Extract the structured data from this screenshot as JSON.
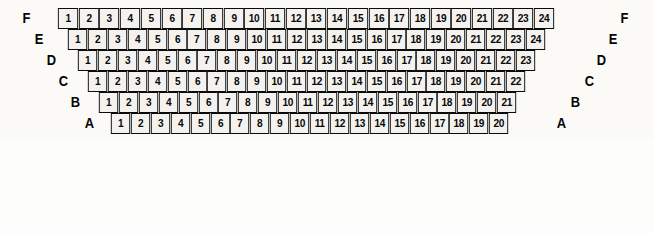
{
  "diagram": {
    "colors": {
      "seat_fill": "#f4f2ee",
      "seat_border": "#0a0a0a",
      "label_color": "#050505",
      "background": "#fbfaf7"
    },
    "rows": [
      {
        "letter": "F",
        "seat_count": 24,
        "seats": [
          1,
          2,
          3,
          4,
          5,
          6,
          7,
          8,
          9,
          10,
          11,
          12,
          13,
          14,
          15,
          16,
          17,
          18,
          19,
          20,
          21,
          22,
          23,
          24
        ],
        "left": 57,
        "top": 8,
        "seat_width": 22.1,
        "label_left_x": 22,
        "label_left_y": 10,
        "label_right_x": 620,
        "label_right_y": 10
      },
      {
        "letter": "E",
        "seat_count": 24,
        "seats": [
          1,
          2,
          3,
          4,
          5,
          6,
          7,
          8,
          9,
          10,
          11,
          12,
          13,
          14,
          15,
          16,
          17,
          18,
          19,
          20,
          21,
          22,
          23,
          24
        ],
        "left": 67,
        "top": 29,
        "seat_width": 21.3,
        "label_left_x": 34,
        "label_left_y": 31,
        "label_right_x": 608,
        "label_right_y": 31
      },
      {
        "letter": "D",
        "seat_count": 23,
        "seats": [
          1,
          2,
          3,
          4,
          5,
          6,
          7,
          8,
          9,
          10,
          11,
          12,
          13,
          14,
          15,
          16,
          17,
          18,
          19,
          20,
          21,
          22,
          23
        ],
        "left": 77,
        "top": 50,
        "seat_width": 21.3,
        "label_left_x": 46,
        "label_left_y": 52,
        "label_right_x": 596,
        "label_right_y": 52
      },
      {
        "letter": "C",
        "seat_count": 22,
        "seats": [
          1,
          2,
          3,
          4,
          5,
          6,
          7,
          8,
          9,
          10,
          11,
          12,
          13,
          14,
          15,
          16,
          17,
          18,
          19,
          20,
          21,
          22
        ],
        "left": 87,
        "top": 71,
        "seat_width": 21.3,
        "label_left_x": 58,
        "label_left_y": 73,
        "label_right_x": 584,
        "label_right_y": 73
      },
      {
        "letter": "B",
        "seat_count": 21,
        "seats": [
          1,
          2,
          3,
          4,
          5,
          6,
          7,
          8,
          9,
          10,
          11,
          12,
          13,
          14,
          15,
          16,
          17,
          18,
          19,
          20,
          21
        ],
        "left": 98,
        "top": 92,
        "seat_width": 21.3,
        "label_left_x": 70,
        "label_left_y": 94,
        "label_right_x": 570,
        "label_right_y": 94
      },
      {
        "letter": "A",
        "seat_count": 20,
        "seats": [
          1,
          2,
          3,
          4,
          5,
          6,
          7,
          8,
          9,
          10,
          11,
          12,
          13,
          14,
          15,
          16,
          17,
          18,
          19,
          20
        ],
        "left": 110,
        "top": 113,
        "seat_width": 21.3,
        "label_left_x": 84,
        "label_left_y": 115,
        "label_right_x": 556,
        "label_right_y": 115
      }
    ]
  }
}
